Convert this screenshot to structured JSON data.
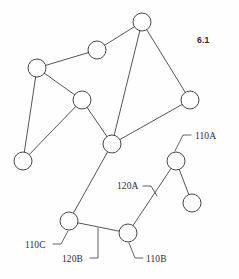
{
  "figure": {
    "number_label": "6.1",
    "number_position": {
      "x": 197,
      "y": 35
    },
    "canvas": {
      "width": 239,
      "height": 279
    },
    "stroke_color": "#444042",
    "node_fill": "#ffffff",
    "node_stroke": "#3f3c3e",
    "background": "#fefefe",
    "node_radius": 9
  },
  "diagram_data": {
    "type": "node-link-graph",
    "title": "6.1",
    "node_radius": 9,
    "nodes": [
      {
        "id": "n-top",
        "x": 142,
        "y": 22,
        "ref": ""
      },
      {
        "id": "n-upper-mid",
        "x": 97,
        "y": 50,
        "ref": ""
      },
      {
        "id": "n-left",
        "x": 37,
        "y": 68,
        "ref": ""
      },
      {
        "id": "n-mid-left",
        "x": 82,
        "y": 100,
        "ref": ""
      },
      {
        "id": "n-right",
        "x": 190,
        "y": 100,
        "ref": ""
      },
      {
        "id": "n-center",
        "x": 112,
        "y": 144,
        "ref": ""
      },
      {
        "id": "n-far-left",
        "x": 23,
        "y": 161,
        "ref": ""
      },
      {
        "id": "n-110a",
        "x": 176,
        "y": 161,
        "ref": "110A"
      },
      {
        "id": "n-right-lower",
        "x": 192,
        "y": 203,
        "ref": ""
      },
      {
        "id": "n-110c",
        "x": 69,
        "y": 221,
        "ref": "110C"
      },
      {
        "id": "n-110b",
        "x": 128,
        "y": 233,
        "ref": "110B"
      }
    ],
    "edges": [
      {
        "id": "e-top-uppermid",
        "from": "n-top",
        "to": "n-upper-mid",
        "ref": ""
      },
      {
        "id": "e-uppermid-left",
        "from": "n-upper-mid",
        "to": "n-left",
        "ref": ""
      },
      {
        "id": "e-top-right",
        "from": "n-top",
        "to": "n-right",
        "ref": ""
      },
      {
        "id": "e-top-center",
        "from": "n-top",
        "to": "n-center",
        "ref": ""
      },
      {
        "id": "e-left-midleft",
        "from": "n-left",
        "to": "n-mid-left",
        "ref": ""
      },
      {
        "id": "e-left-farleft",
        "from": "n-left",
        "to": "n-far-left",
        "ref": ""
      },
      {
        "id": "e-midleft-farleft",
        "from": "n-mid-left",
        "to": "n-far-left",
        "ref": ""
      },
      {
        "id": "e-midleft-center",
        "from": "n-mid-left",
        "to": "n-center",
        "ref": ""
      },
      {
        "id": "e-right-center",
        "from": "n-right",
        "to": "n-center",
        "ref": ""
      },
      {
        "id": "e-center-110c",
        "from": "n-center",
        "to": "n-110c",
        "ref": ""
      },
      {
        "id": "e-110c-110b",
        "from": "n-110c",
        "to": "n-110b",
        "ref": "120B"
      },
      {
        "id": "e-110b-110a",
        "from": "n-110b",
        "to": "n-110a",
        "ref": "120A"
      },
      {
        "id": "e-110a-rightlower",
        "from": "n-110a",
        "to": "n-right-lower",
        "ref": ""
      }
    ],
    "callouts": [
      {
        "id": "callout-110a",
        "text": "110A",
        "text_x": 195,
        "text_y": 139,
        "anchor": "start",
        "leader": "M 191 135 L 183 135 L 175 151"
      },
      {
        "id": "callout-120a",
        "text": "120A",
        "text_x": 117,
        "text_y": 189,
        "anchor": "start",
        "leader": "M 143 186 L 151 186 L 157 196"
      },
      {
        "id": "callout-110c",
        "text": "110C",
        "text_x": 25,
        "text_y": 248,
        "anchor": "start",
        "leader": "M 53 244 L 61 244 L 68 231"
      },
      {
        "id": "callout-120b",
        "text": "120B",
        "text_x": 62,
        "text_y": 262,
        "anchor": "start",
        "leader": "M 90 258 L 98 258 L 98 228"
      },
      {
        "id": "callout-110b",
        "text": "110B",
        "text_x": 146,
        "text_y": 262,
        "anchor": "start",
        "leader": "M 143 258 L 135 258 L 129 243"
      }
    ]
  }
}
